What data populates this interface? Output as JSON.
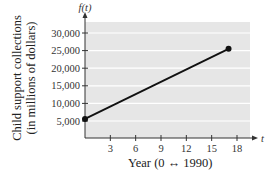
{
  "chart_data": {
    "type": "line",
    "title": "",
    "xlabel": "Year (0 ↔ 1990)",
    "ylabel": "Child support collections (in millions of dollars)",
    "ylabel_lines": [
      "Child support collections",
      "(in millions of dollars)"
    ],
    "x_axis_name": "t",
    "y_axis_name": "f(t)",
    "x_ticks": [
      3,
      6,
      9,
      12,
      15,
      18
    ],
    "y_ticks": [
      5000,
      10000,
      15000,
      20000,
      25000,
      30000
    ],
    "y_tick_labels": [
      "5,000",
      "10,000",
      "15,000",
      "20,000",
      "25,000",
      "30,000"
    ],
    "xlim": [
      0,
      19.5
    ],
    "ylim": [
      0,
      32000
    ],
    "grid": "horizontal",
    "series": [
      {
        "name": "f(t)",
        "x": [
          0,
          17
        ],
        "values": [
          5600,
          25500
        ],
        "markers": "endpoints"
      }
    ],
    "colors": {
      "plot_bg": "#e6e6e6",
      "grid": "#ffffff",
      "line": "#111111",
      "axis": "#333333"
    }
  }
}
